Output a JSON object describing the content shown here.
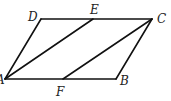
{
  "figure": {
    "type": "parallelogram-diagram",
    "stroke_color": "#111111",
    "label_color": "#222222"
  },
  "points": {
    "A": {
      "label": "A",
      "x": 5,
      "y": 79,
      "label_x": -4,
      "label_y": 84
    },
    "B": {
      "label": "B",
      "x": 116,
      "y": 79,
      "label_x": 120,
      "label_y": 85
    },
    "C": {
      "label": "C",
      "x": 152,
      "y": 19,
      "label_x": 157,
      "label_y": 23
    },
    "D": {
      "label": "D",
      "x": 41,
      "y": 19,
      "label_x": 28,
      "label_y": 21
    },
    "E": {
      "label": "E",
      "x": 93,
      "y": 19,
      "label_x": 90,
      "label_y": 14
    },
    "F": {
      "label": "F",
      "x": 63,
      "y": 79,
      "label_x": 56,
      "label_y": 96
    }
  },
  "segments": [
    {
      "from": "A",
      "to": "B"
    },
    {
      "from": "B",
      "to": "C"
    },
    {
      "from": "C",
      "to": "D"
    },
    {
      "from": "D",
      "to": "A"
    },
    {
      "from": "A",
      "to": "E"
    },
    {
      "from": "F",
      "to": "C"
    }
  ]
}
